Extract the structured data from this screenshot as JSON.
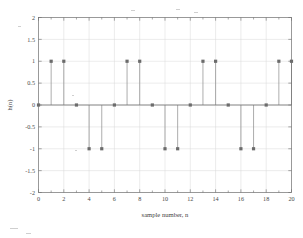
{
  "chart_data": {
    "type": "scatter",
    "title": "",
    "subtitle": "",
    "xlabel": "sample number, n",
    "ylabel": "h(n)",
    "xlim": [
      0,
      20
    ],
    "ylim": [
      -2,
      2
    ],
    "xticks": [
      0,
      2,
      4,
      6,
      8,
      10,
      12,
      14,
      16,
      18,
      20
    ],
    "xticklabels": [
      "0",
      "2",
      "4",
      "6",
      "8",
      "10",
      "12",
      "14",
      "16",
      "18",
      "20"
    ],
    "yticks": [
      -2,
      -1.5,
      -1,
      -0.5,
      0,
      0.5,
      1,
      1.5,
      2
    ],
    "yticklabels": [
      "-2",
      "-1.5",
      "-1",
      "-0.5",
      "0",
      "0.5",
      "1",
      "1.5",
      "2"
    ],
    "grid": true,
    "legend": null,
    "legend_position": "none",
    "marker_style": "square",
    "stem_baseline": 0,
    "x": [
      0,
      1,
      2,
      3,
      4,
      5,
      6,
      7,
      8,
      9,
      10,
      11,
      12,
      13,
      14,
      15,
      16,
      17,
      18,
      19,
      20
    ],
    "values": [
      0,
      1,
      1,
      0,
      -1,
      -1,
      0,
      1,
      1,
      0,
      -1,
      -1,
      0,
      1,
      1,
      0,
      -1,
      -1,
      0,
      1,
      1
    ],
    "series": [
      {
        "name": "h(n)",
        "values": [
          0,
          1,
          1,
          0,
          -1,
          -1,
          0,
          1,
          1,
          0,
          -1,
          -1,
          0,
          1,
          1,
          0,
          -1,
          -1,
          0,
          1,
          1
        ]
      }
    ],
    "annotations": [],
    "colors": {
      "stem": "#8a8a8a",
      "marker": "#6b6b6b",
      "axis": "#6e6e6e",
      "grid": "#d8d8d8",
      "background": "#ffffff"
    }
  },
  "figure": {
    "background_color": "#ffffff",
    "axes_border": true
  }
}
